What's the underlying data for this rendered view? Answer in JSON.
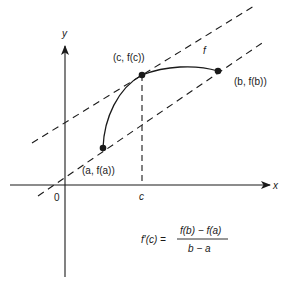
{
  "diagram": {
    "axes": {
      "x_label": "x",
      "y_label": "y",
      "origin_label": "0",
      "c_tick_label": "c"
    },
    "points": {
      "a": {
        "label": "(a, f(a))"
      },
      "c": {
        "label": "(c, f(c))"
      },
      "b": {
        "label": "(b, f(b))"
      }
    },
    "curve_label": "f",
    "formula": {
      "lhs": "f′(c) =",
      "numerator": "f(b) − f(a)",
      "denominator": "b − a"
    },
    "colors": {
      "ink": "#1a1a1a",
      "background": "#ffffff"
    }
  }
}
